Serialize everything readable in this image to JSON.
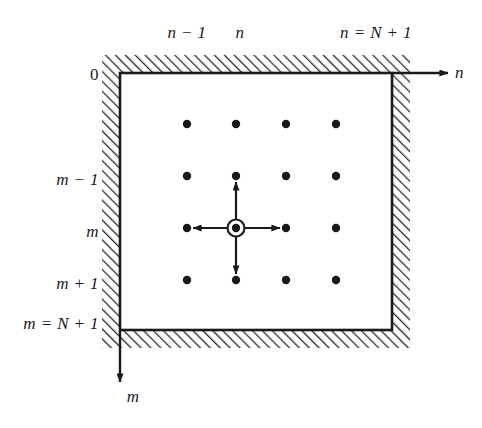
{
  "figure": {
    "type": "finite-difference-grid-stencil-diagram",
    "background_color": "#ffffff",
    "line_color": "#1a1a1a",
    "hatch_color": "#2b2b2b",
    "labels": {
      "top_n_minus_1": "n − 1",
      "top_n": "n",
      "top_n_equals_N_plus_1": "n = N + 1",
      "left_zero": "0",
      "left_m_minus_1": "m − 1",
      "left_m": "m",
      "left_m_plus_1": "m + 1",
      "left_m_equals_N_plus_1": "m = N + 1",
      "axis_n": "n",
      "axis_m": "m"
    },
    "grid": {
      "columns": 4,
      "rows": 4,
      "column_x": [
        187,
        236,
        286,
        336
      ],
      "row_y": [
        124,
        176,
        228,
        280
      ],
      "dot_radius": 4.2
    },
    "stencil": {
      "center_column_index": 1,
      "center_row_index": 2,
      "center_x": 236,
      "center_y": 228,
      "ring_outer_radius": 8.5,
      "ring_inner_radius": 4.2,
      "arrow_directions": [
        "up",
        "down",
        "left",
        "right"
      ]
    },
    "frame": {
      "inner_left": 120,
      "inner_top": 73,
      "inner_right": 392,
      "inner_bottom": 330,
      "hatch_band_width": 18
    },
    "axes": {
      "n_axis_y": 73,
      "n_axis_end_x": 448,
      "m_axis_x": 120,
      "m_axis_end_y": 382
    }
  }
}
